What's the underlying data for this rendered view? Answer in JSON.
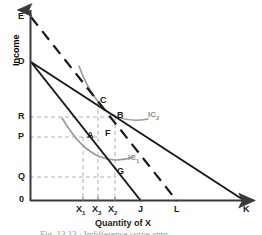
{
  "figure": {
    "title_caption": "Fig. 13.13 : Indifference curve appr...",
    "x_axis_title": "Quantity of X",
    "y_axis_title": "Income"
  },
  "axes": {
    "origin_label": "0",
    "y_ticks": [
      {
        "label": "E",
        "y": 17
      },
      {
        "label": "D",
        "y": 62
      },
      {
        "label": "R",
        "y": 117
      },
      {
        "label": "P",
        "y": 137
      },
      {
        "label": "Q",
        "y": 177
      }
    ],
    "x_ticks": [
      {
        "label": "X",
        "sub": "1",
        "x": 83
      },
      {
        "label": "X",
        "sub": "3",
        "x": 98
      },
      {
        "label": "X",
        "sub": "2",
        "x": 114
      },
      {
        "label": "J",
        "sub": "",
        "x": 141
      },
      {
        "label": "L",
        "sub": "",
        "x": 177
      },
      {
        "label": "K",
        "sub": "",
        "x": 245
      }
    ]
  },
  "points": [
    {
      "name": "A",
      "label": "A",
      "x": 86,
      "y": 137
    },
    {
      "name": "B",
      "label": "B",
      "x": 114,
      "y": 117
    },
    {
      "name": "C",
      "label": "C",
      "x": 98,
      "y": 103
    },
    {
      "name": "F",
      "label": "F",
      "x": 107,
      "y": 133
    },
    {
      "name": "G",
      "label": "G",
      "x": 115,
      "y": 172
    }
  ],
  "curves": [
    {
      "name": "IC1",
      "label": "IC",
      "sub": "1",
      "color": "#9b9b9b",
      "label_x": 128,
      "label_y": 155
    },
    {
      "name": "IC2",
      "label": "IC",
      "sub": "2",
      "color": "#9b9b9b",
      "label_x": 148,
      "label_y": 112
    }
  ],
  "budget_lines": [
    {
      "name": "DJ",
      "from": "D",
      "to": "J",
      "style": "solid",
      "color": "#1a1a1a"
    },
    {
      "name": "DK",
      "from": "D",
      "to": "K",
      "style": "solid",
      "color": "#1a1a1a"
    },
    {
      "name": "EL",
      "from": "E",
      "to": "L",
      "style": "dashed",
      "color": "#1a1a1a"
    }
  ],
  "guide_lines": [
    {
      "name": "R-to-C",
      "orientation": "horizontal",
      "level": "R"
    },
    {
      "name": "P-to-A",
      "orientation": "horizontal",
      "level": "P"
    },
    {
      "name": "Q-to-G",
      "orientation": "horizontal",
      "level": "Q"
    },
    {
      "name": "X1-vertical",
      "orientation": "vertical",
      "level": "X1"
    },
    {
      "name": "X3-vertical",
      "orientation": "vertical",
      "level": "X3"
    },
    {
      "name": "X2-vertical",
      "orientation": "vertical",
      "level": "X2"
    }
  ],
  "colors": {
    "axis": "#3a3a3a",
    "line": "#1a1a1a",
    "indifference": "#9b9b9b",
    "guide": "#b0b0b0"
  }
}
